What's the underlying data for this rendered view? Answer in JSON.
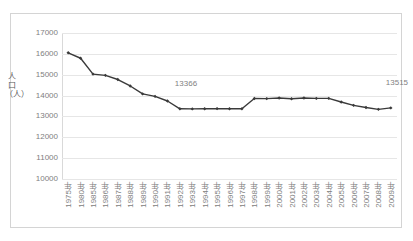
{
  "chart_data": {
    "type": "line",
    "title": "",
    "xlabel": "",
    "ylabel": "人口（人）",
    "ylim": [
      10000,
      17000
    ],
    "ytick_step": 1000,
    "yticks": [
      "17000",
      "16000",
      "15000",
      "14000",
      "13000",
      "12000",
      "11000",
      "10000"
    ],
    "ytick_values": [
      17000,
      16000,
      15000,
      14000,
      13000,
      12000,
      11000,
      10000
    ],
    "grid": true,
    "legend": "none",
    "series_color": "#3a3a3a",
    "marker": "diamond",
    "categories": [
      "1975年",
      "1980年",
      "1985年",
      "1986年",
      "1987年",
      "1988年",
      "1989年",
      "1990年",
      "1991年",
      "1992年",
      "1993年",
      "1994年",
      "1995年",
      "1996年",
      "1997年",
      "1998年",
      "1999年",
      "2000年",
      "2001年",
      "2002年",
      "2003年",
      "2004年",
      "2005年",
      "2006年",
      "2007年",
      "2008年",
      "2009年"
    ],
    "values": [
      16050,
      15790,
      15030,
      14970,
      14770,
      14460,
      14080,
      13960,
      13740,
      13366,
      13360,
      13365,
      13375,
      13370,
      13365,
      13860,
      13855,
      13885,
      13850,
      13880,
      13865,
      13865,
      13690,
      13530,
      13430,
      13340,
      13410
    ],
    "annotations": [
      {
        "text": "13366",
        "category": "1992年",
        "value": 13366
      },
      {
        "text": "13515",
        "category": "2009年",
        "value": 13515
      }
    ]
  },
  "colors": {
    "border": "#d4d4d4",
    "gridline": "#e6e6e6",
    "tick_text": "#808080",
    "axis_title": "#595959",
    "line": "#3a3a3a",
    "annotation_text": "#7f7f7f",
    "background": "#ffffff"
  }
}
